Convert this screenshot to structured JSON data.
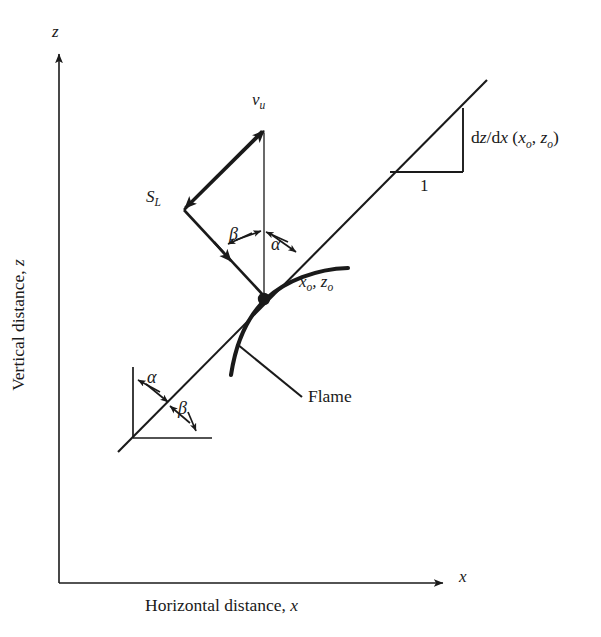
{
  "figure": {
    "background_color": "#ffffff",
    "ink_color": "#1a1a1a",
    "width": 601,
    "height": 637
  },
  "axes": {
    "x_axis": {
      "tip_label": "x",
      "caption_prefix": "Horizontal distance, ",
      "caption_symbol": "x"
    },
    "y_axis": {
      "tip_label": "z",
      "caption_prefix": "Vertical distance, ",
      "caption_symbol": "z"
    }
  },
  "vectors": {
    "unburned_velocity": {
      "symbol": "v",
      "subscript": "u"
    },
    "laminar_speed": {
      "symbol": "S",
      "subscript": "L"
    }
  },
  "angles": {
    "upper": {
      "beta": "β",
      "alpha": "α"
    },
    "lower": {
      "alpha": "α",
      "beta": "β"
    }
  },
  "slope": {
    "expression_main": "d",
    "expression": "dz/dx (x",
    "numerator_d": "d",
    "numerator_z": "z",
    "slash": "/",
    "denominator_d": "d",
    "denominator_x": "x",
    "open_paren": " (",
    "arg_x": "x",
    "arg_x_sub": "o",
    "comma": ", ",
    "arg_z": "z",
    "arg_z_sub": "o",
    "close_paren": ")",
    "run_label": "1"
  },
  "point": {
    "x_symbol": "x",
    "x_sub": "o",
    "separator": ", ",
    "z_symbol": "z",
    "z_sub": "o"
  },
  "annotations": {
    "flame_label": "Flame"
  }
}
